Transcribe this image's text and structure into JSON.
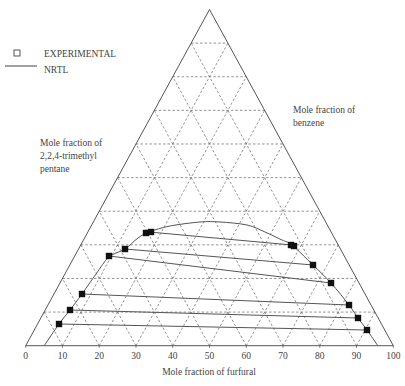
{
  "chart_data": {
    "type": "ternary",
    "title": "",
    "legend": [
      {
        "label": "EXPERIMENTAL",
        "marker": "square"
      },
      {
        "label": "NRTL",
        "marker": "line"
      }
    ],
    "axes": {
      "bottom": {
        "label": "Mole fraction of furfural",
        "ticks": [
          "0",
          "10",
          "20",
          "30",
          "40",
          "50",
          "60",
          "70",
          "80",
          "90",
          "100"
        ],
        "range": [
          0,
          100
        ]
      },
      "left": {
        "label_lines": [
          "Mole fraction of",
          "2,2,4-trimethyl",
          "pentane"
        ]
      },
      "right": {
        "label_lines": [
          "Mole fraction of",
          "benzene"
        ]
      }
    },
    "grid": {
      "step": 10,
      "style": "dashed"
    },
    "triangle_px": {
      "left": [
        25.7,
        345.7
      ],
      "right": [
        393.3,
        345.7
      ],
      "apex": [
        209.5,
        9.5
      ]
    },
    "binodal_curve_px": [
      [
        44,
        346
      ],
      [
        59,
        324
      ],
      [
        70,
        310
      ],
      [
        82,
        294
      ],
      [
        96,
        274
      ],
      [
        109,
        257
      ],
      [
        125,
        249
      ],
      [
        138,
        238
      ],
      [
        149,
        232
      ],
      [
        170,
        226
      ],
      [
        200,
        222
      ],
      [
        220,
        222
      ],
      [
        247,
        225
      ],
      [
        265,
        232
      ],
      [
        282,
        240
      ],
      [
        292,
        245
      ],
      [
        313,
        265
      ],
      [
        331,
        283
      ],
      [
        349,
        305
      ],
      [
        358,
        318
      ],
      [
        367,
        330
      ],
      [
        378,
        346
      ]
    ],
    "tie_lines_px": [
      {
        "left": [
          149,
          232
        ],
        "right": [
          292,
          245
        ]
      },
      {
        "left": [
          125,
          249
        ],
        "right": [
          313,
          265
        ]
      },
      {
        "left": [
          109,
          256
        ],
        "right": [
          331,
          283
        ]
      },
      {
        "left": [
          82,
          294
        ],
        "right": [
          349,
          305
        ]
      },
      {
        "left": [
          70,
          310
        ],
        "right": [
          358,
          318
        ]
      },
      {
        "left": [
          59,
          324
        ],
        "right": [
          367,
          330
        ]
      }
    ],
    "experimental_points_px": [
      [
        146,
        233
      ],
      [
        151,
        232
      ],
      [
        125,
        249
      ],
      [
        109,
        256
      ],
      [
        82,
        294
      ],
      [
        70,
        310
      ],
      [
        59,
        324
      ],
      [
        291,
        245
      ],
      [
        294,
        246
      ],
      [
        313,
        265
      ],
      [
        331,
        283
      ],
      [
        349,
        305
      ],
      [
        358,
        318
      ],
      [
        367,
        330
      ]
    ],
    "tie_lines_furfural_pct_approx": [
      {
        "raffinate_furfural": 23,
        "extract_furfural": 70
      },
      {
        "raffinate_furfural": 22,
        "extract_furfural": 78
      },
      {
        "raffinate_furfural": 19,
        "extract_furfural": 83
      },
      {
        "raffinate_furfural": 15,
        "extract_furfural": 88
      },
      {
        "raffinate_furfural": 12,
        "extract_furfural": 91
      },
      {
        "raffinate_furfural": 9,
        "extract_furfural": 93
      }
    ]
  },
  "legend": {
    "experimental_label": "EXPERIMENTAL",
    "nrtl_label": "NRTL"
  },
  "labels": {
    "left_line1": "Mole fraction of",
    "left_line2": "2,2,4-trimethyl",
    "left_line3": "pentane",
    "right_line1": "Mole fraction of",
    "right_line2": "benzene",
    "bottom": "Mole fraction of furfural"
  },
  "colors": {
    "axis": "#555555",
    "grid": "#666666",
    "curve": "#555555",
    "marker": "#111111"
  }
}
